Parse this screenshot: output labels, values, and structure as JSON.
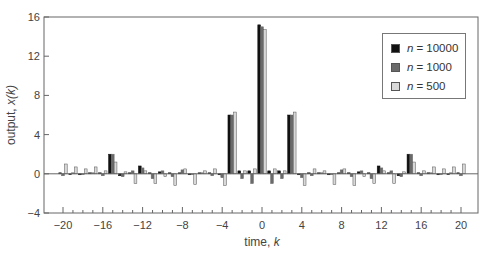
{
  "chart_data": {
    "type": "bar",
    "title": "",
    "xlabel": "time, k",
    "ylabel": "output, x(k)",
    "xlim": [
      -21,
      21.7
    ],
    "ylim": [
      -4,
      16
    ],
    "xticks": [
      -20,
      -16,
      -12,
      -8,
      -4,
      0,
      4,
      8,
      12,
      16,
      20
    ],
    "yticks": [
      -4,
      0,
      4,
      8,
      12,
      16
    ],
    "grid": false,
    "legend_position": "upper right",
    "x": [
      -20,
      -19,
      -18,
      -17,
      -16,
      -15,
      -14,
      -13,
      -12,
      -11,
      -10,
      -9,
      -8,
      -7,
      -6,
      -5,
      -4,
      -3,
      -2,
      -1,
      0,
      1,
      2,
      3,
      4,
      5,
      6,
      7,
      8,
      9,
      10,
      11,
      12,
      13,
      14,
      15,
      16,
      17,
      18,
      19,
      20
    ],
    "series": [
      {
        "name": "n = 10000",
        "color": "#111111",
        "values": [
          0.1,
          0.0,
          -0.1,
          0.1,
          0.1,
          2.0,
          -0.2,
          0.1,
          0.8,
          0.1,
          0.2,
          0.1,
          0.1,
          -0.1,
          0.1,
          0.1,
          -0.1,
          6.0,
          0.3,
          0.3,
          15.2,
          0.3,
          0.3,
          6.0,
          -0.1,
          0.1,
          0.1,
          -0.1,
          0.1,
          0.1,
          0.2,
          0.1,
          0.8,
          0.1,
          -0.2,
          2.0,
          0.1,
          0.1,
          -0.1,
          0.0,
          0.1
        ]
      },
      {
        "name": "n = 1000",
        "color": "#6a6a6a",
        "values": [
          -0.2,
          0.1,
          0.0,
          0.1,
          -0.2,
          2.0,
          -0.3,
          0.3,
          0.6,
          -0.5,
          0.3,
          -0.3,
          0.4,
          0.0,
          0.1,
          -0.2,
          -0.4,
          6.0,
          -0.5,
          -1.0,
          15.0,
          -1.0,
          -0.5,
          6.0,
          -0.4,
          -0.2,
          0.1,
          0.0,
          0.4,
          -0.3,
          0.3,
          -0.5,
          0.6,
          0.3,
          -0.3,
          2.0,
          -0.2,
          0.1,
          0.0,
          0.1,
          -0.2
        ]
      },
      {
        "name": "n = 500",
        "color": "#d8d8d8",
        "values": [
          1.0,
          0.7,
          0.5,
          0.7,
          0.3,
          1.2,
          0.2,
          -1.0,
          0.3,
          -1.0,
          -0.3,
          -1.2,
          0.5,
          -1.1,
          0.3,
          0.5,
          -1.2,
          6.3,
          0.3,
          0.5,
          14.7,
          0.5,
          0.3,
          6.3,
          -1.2,
          0.5,
          0.3,
          -1.1,
          0.5,
          -1.2,
          -0.3,
          -1.0,
          0.3,
          -1.0,
          0.2,
          1.2,
          0.3,
          0.7,
          0.5,
          0.7,
          1.0
        ]
      }
    ]
  },
  "legend": {
    "items": [
      {
        "var": "n",
        "text": "= 10000",
        "color": "#111111"
      },
      {
        "var": "n",
        "text": "= 1000",
        "color": "#6a6a6a"
      },
      {
        "var": "n",
        "text": "= 500",
        "color": "#d8d8d8"
      }
    ]
  },
  "axes": {
    "xlabel_prefix": "time, ",
    "xlabel_var": "k",
    "ylabel_prefix": "output, ",
    "ylabel_var": "x(k)"
  }
}
